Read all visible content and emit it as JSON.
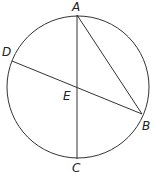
{
  "diagram": {
    "type": "circle-with-chords",
    "circle": {
      "cx": 78,
      "cy": 87,
      "r": 71
    },
    "points": {
      "A": {
        "label": "A",
        "x": 77,
        "y": 15
      },
      "B": {
        "label": "B",
        "x": 142,
        "y": 114
      },
      "C": {
        "label": "C",
        "x": 77,
        "y": 159
      },
      "D": {
        "label": "D",
        "x": 12,
        "y": 61
      },
      "E": {
        "label": "E",
        "x": 77,
        "y": 88
      }
    },
    "segments": [
      "AC",
      "DB",
      "AB"
    ],
    "stroke_color": "#333333"
  }
}
